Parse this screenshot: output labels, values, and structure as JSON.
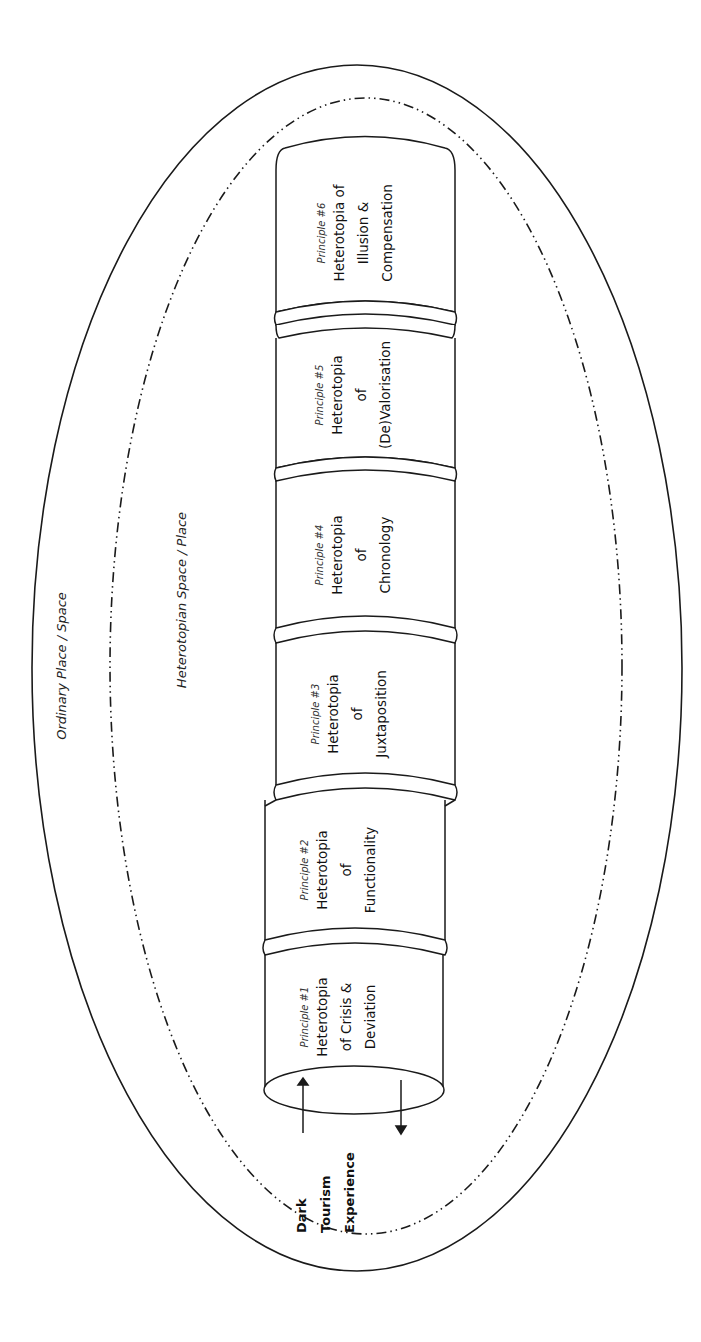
{
  "diagram": {
    "outer_region_label": "Ordinary Place / Space",
    "inner_region_label": "Heterotopian Space / Place",
    "entry_label": {
      "line1": "Dark",
      "line2": "Tourism",
      "line3": "Experience"
    },
    "segments": [
      {
        "principle": "Principle #1",
        "lines": [
          "Heterotopia",
          "of Crisis &",
          "Deviation"
        ]
      },
      {
        "principle": "Principle #2",
        "lines": [
          "Heterotopia",
          "of",
          "Functionality"
        ]
      },
      {
        "principle": "Principle #3",
        "lines": [
          "Heterotopia",
          "of",
          "Juxtaposition"
        ]
      },
      {
        "principle": "Principle #4",
        "lines": [
          "Heterotopia",
          "of",
          "Chronology"
        ]
      },
      {
        "principle": "Principle #5",
        "lines": [
          "Heterotopia",
          "of",
          "(De)Valorisation"
        ]
      },
      {
        "principle": "Principle #6",
        "lines": [
          "Heterotopia of",
          "Illusion &",
          "Compensation"
        ]
      }
    ],
    "colors": {
      "stroke": "#1a1a1a",
      "background": "#ffffff"
    }
  }
}
